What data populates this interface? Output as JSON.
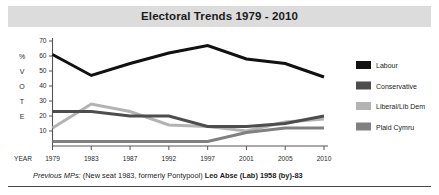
{
  "header": {
    "title": "Electoral Trends 1979 - 2010"
  },
  "axis": {
    "y_title_letters": [
      "%",
      "V",
      "O",
      "T",
      "E"
    ],
    "y_ticks": [
      70,
      60,
      50,
      40,
      30,
      20,
      10
    ],
    "x_axis_title": "YEAR"
  },
  "legend": {
    "items": [
      {
        "label": "Labour",
        "color": "#111111"
      },
      {
        "label": "Conservative",
        "color": "#4d4d4d"
      },
      {
        "label": "Liberal/Lib Dem",
        "color": "#b3b3b3"
      },
      {
        "label": "Plaid Cymru",
        "color": "#808080"
      }
    ]
  },
  "footnote": {
    "prefix": "Previous MPs:",
    "seat_note": "(New seat 1983, formerly Pontypool)",
    "mp": "Leo Abse (Lab) 1958 (by)-83"
  },
  "chart_data": {
    "type": "line",
    "title": "Electoral Trends 1979 - 2010",
    "xlabel": "YEAR",
    "ylabel": "% VOTE",
    "categories": [
      "1979",
      "1983",
      "1987",
      "1992",
      "1997",
      "2001",
      "2005",
      "2010"
    ],
    "ylim": [
      0,
      70
    ],
    "yticks": [
      10,
      20,
      30,
      40,
      50,
      60,
      70
    ],
    "grid": false,
    "legend_position": "right",
    "series": [
      {
        "name": "Labour",
        "color": "#111111",
        "values": [
          61,
          47,
          55,
          62,
          67,
          58,
          55,
          46
        ]
      },
      {
        "name": "Conservative",
        "color": "#4d4d4d",
        "values": [
          23,
          23,
          20,
          20,
          13,
          13,
          15,
          20
        ]
      },
      {
        "name": "Liberal/Lib Dem",
        "color": "#b3b3b3",
        "values": [
          12,
          28,
          23,
          14,
          13,
          10,
          16,
          18
        ]
      },
      {
        "name": "Plaid Cymru",
        "color": "#808080",
        "values": [
          3,
          3,
          3,
          3,
          3,
          9,
          12,
          12
        ]
      }
    ]
  }
}
